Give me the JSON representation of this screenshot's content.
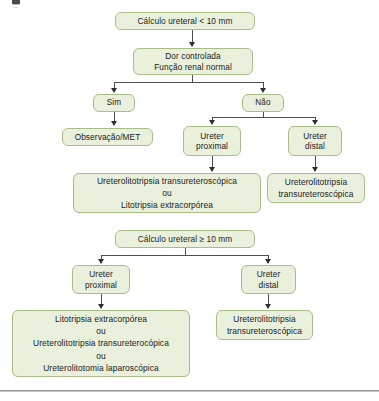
{
  "figure": {
    "kind": "clinical-flowchart",
    "language": "pt-BR",
    "colors": {
      "node_fill": "#e9f0dc",
      "node_border": "#a9bd8a",
      "connector": "#4d4d4d",
      "text": "#1b1b1b",
      "page_rule": "#9a9a9a"
    }
  },
  "upper_algorithm": {
    "root": "Cálculo ureteral < 10 mm",
    "criteria": "Dor controlada\nFunção renal normal",
    "branch_yes": "Sim",
    "branch_no": "Não",
    "yes_outcome": "Observação/MET",
    "no_proximal": "Ureter\nproximal",
    "no_distal": "Ureter\ndistal",
    "proximal_treatment": "Ureterolitotripsia transureteroscópica\nou\nLitotripsia extracorpórea",
    "distal_treatment": "Ureterolitotripsia\ntransureteroscópica"
  },
  "lower_algorithm": {
    "root": "Cálculo ureteral ≥ 10 mm",
    "proximal": "Ureter\nproximal",
    "distal": "Ureter\ndistal",
    "proximal_treatment": "Litotripsia extracorpórea\nou\nUreterolitotripsia transureterocópica\nou\nUreterolitotomia laparoscópica",
    "distal_treatment": "Ureterolitotripsia\ntransureteroscópica"
  }
}
